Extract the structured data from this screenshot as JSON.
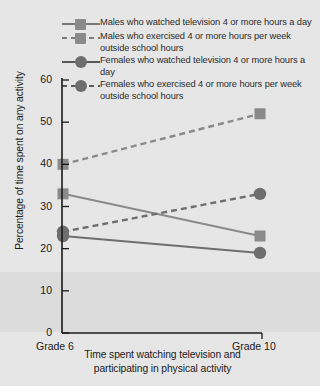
{
  "chart_data": {
    "type": "line",
    "title": "",
    "xlabel": "Time spent watching television and participating in physical activity",
    "ylabel": "Percentage of time spent on any activity",
    "categories": [
      "Grade 6",
      "Grade 10"
    ],
    "ylim": [
      0,
      60
    ],
    "yticks": [
      0,
      10,
      20,
      30,
      40,
      50,
      60
    ],
    "grid": false,
    "legend_position": "top",
    "series": [
      {
        "name": "Males who watched television 4 or more hours a day",
        "values": [
          33,
          23
        ],
        "marker": "square",
        "line": "solid",
        "color": "#8a8a8a"
      },
      {
        "name": "Males who exercised 4 or more hours per week outside school hours",
        "values": [
          40,
          52
        ],
        "marker": "square",
        "line": "dashed",
        "color": "#8a8a8a"
      },
      {
        "name": "Females who watched television 4 or more hours a day",
        "values": [
          23,
          19
        ],
        "marker": "circle",
        "line": "solid",
        "color": "#6e6e6e"
      },
      {
        "name": "Females who exercised 4 or more hours per week outside school hours",
        "values": [
          24,
          33
        ],
        "marker": "circle",
        "line": "dashed",
        "color": "#6e6e6e"
      }
    ]
  },
  "axis": {
    "y_labels": [
      "60",
      "50",
      "40",
      "30",
      "20",
      "10",
      "0"
    ],
    "x_label_left": "Grade 6",
    "x_label_right": "Grade 10",
    "y_title": "Percentage of time spent on any activity",
    "x_title_line1": "Time spent watching television and",
    "x_title_line2": "participating in physical activity"
  },
  "legend": {
    "entries": [
      {
        "label": "Males who watched television 4 or more hours a day",
        "marker": "square",
        "line": "solid"
      },
      {
        "label": "Males who exercised 4 or more hours per week outside school hours",
        "marker": "square",
        "line": "dashed"
      },
      {
        "label": "Females who watched television 4 or more hours a day",
        "marker": "circle",
        "line": "solid"
      },
      {
        "label": "Females who exercised 4 or more hours per week outside school hours",
        "marker": "circle",
        "line": "dashed"
      }
    ]
  },
  "colors": {
    "background": "#e6e6e6",
    "band": "#dcdcdc",
    "male_series": "#8a8a8a",
    "female_series": "#6e6e6e",
    "axis": "#1a1a1a"
  }
}
